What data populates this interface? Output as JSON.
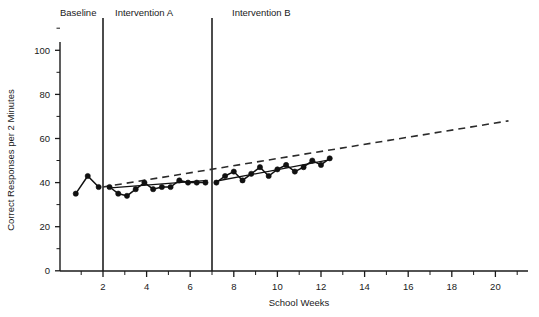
{
  "chart_data": {
    "type": "line",
    "title": "",
    "xlabel": "School Weeks",
    "ylabel": "Correct Responses per 2 Minutes",
    "xlim": [
      0,
      21.5
    ],
    "ylim": [
      0,
      112
    ],
    "grid": false,
    "legend": "none",
    "x_ticks_major": [
      2,
      4,
      6,
      8,
      10,
      12,
      14,
      16,
      18,
      20
    ],
    "x_ticks_minor": [
      1,
      3,
      5,
      7,
      9,
      11,
      13,
      15,
      17,
      19,
      21
    ],
    "x_tick_labels": [
      "2",
      "4",
      "6",
      "8",
      "10",
      "12",
      "14",
      "16",
      "18",
      "20"
    ],
    "y_ticks_major": [
      0,
      20,
      40,
      60,
      80,
      100
    ],
    "y_ticks_minor": [
      10,
      30,
      50,
      70,
      90,
      110
    ],
    "y_tick_labels": [
      "0",
      "20",
      "40",
      "60",
      "80",
      "100"
    ],
    "phase_lines": [
      {
        "name": "baseline-to-intervention-a",
        "x": 2.0
      },
      {
        "name": "intervention-a-to-intervention-b",
        "x": 7.0
      }
    ],
    "phase_labels": [
      {
        "label": "Baseline",
        "x": 1.0
      },
      {
        "label": "Intervention A",
        "x": 4.3
      },
      {
        "label": "Intervention B",
        "x": 10.3
      }
    ],
    "series": [
      {
        "name": "Baseline",
        "marker": "filled-circle",
        "x": [
          0.75,
          1.3,
          1.8
        ],
        "values": [
          35,
          43,
          38
        ]
      },
      {
        "name": "Intervention A",
        "marker": "filled-circle",
        "x": [
          2.3,
          2.7,
          3.1,
          3.5,
          3.9,
          4.3,
          4.7,
          5.1,
          5.5,
          5.9,
          6.3,
          6.7
        ],
        "values": [
          38,
          35,
          34,
          37,
          40,
          37,
          38,
          38,
          41,
          40,
          40,
          40
        ]
      },
      {
        "name": "Intervention B",
        "marker": "filled-circle",
        "x": [
          7.2,
          7.6,
          8.0,
          8.4,
          8.8,
          9.2,
          9.6,
          10.0,
          10.4,
          10.8,
          11.2,
          11.6,
          12.0,
          12.4
        ],
        "values": [
          40,
          43,
          45,
          41,
          44,
          47,
          43,
          46,
          48,
          45,
          47,
          50,
          48,
          51
        ]
      }
    ],
    "trend_lines": [
      {
        "name": "intervention-a-trend",
        "x": [
          2.2,
          6.8
        ],
        "values": [
          37.5,
          41.0
        ]
      },
      {
        "name": "intervention-b-trend",
        "x": [
          7.1,
          12.5
        ],
        "values": [
          40.5,
          50.5
        ]
      }
    ],
    "aim_line": {
      "name": "goal-aim-line",
      "style": "dashed",
      "x": [
        2.0,
        20.6
      ],
      "values": [
        38.0,
        68.0
      ]
    }
  }
}
